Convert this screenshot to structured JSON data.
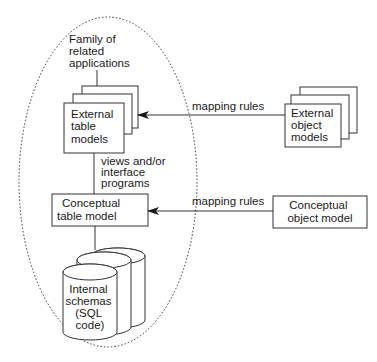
{
  "diagram": {
    "boundary": {
      "label_lines": [
        "Family of",
        "related",
        "applications"
      ],
      "style": "dotted-ellipse"
    },
    "nodes": {
      "external_table_models": {
        "lines": [
          "External",
          "table",
          "models"
        ],
        "stacked": true
      },
      "conceptual_table_model": {
        "lines": [
          "Conceptual",
          "table model"
        ]
      },
      "internal_schemas": {
        "lines": [
          "Internal",
          "schemas",
          "(SQL",
          "code)"
        ],
        "shape": "stacked-cylinders"
      },
      "external_object_models": {
        "lines": [
          "External",
          "object",
          "models"
        ],
        "stacked": true
      },
      "conceptual_object_model": {
        "lines": [
          "Conceptual",
          "object model"
        ]
      }
    },
    "edges": {
      "views_label": [
        "views and/or",
        "interface",
        "programs"
      ],
      "mapping_rules_top": "mapping rules",
      "mapping_rules_bottom": "mapping rules"
    },
    "colors": {
      "stroke": "#333333",
      "text": "#1a1a1a",
      "background": "#ffffff"
    }
  }
}
